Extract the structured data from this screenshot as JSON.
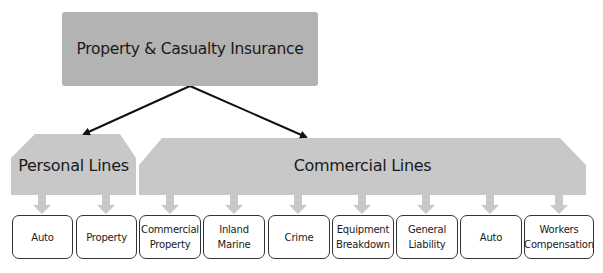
{
  "diagram": {
    "root": {
      "label": "Property & Casualty Insurance",
      "color": "#b3b3b3"
    },
    "categories": [
      {
        "label": "Personal Lines",
        "color": "#c8c8c8",
        "children": [
          {
            "label": "Auto"
          },
          {
            "label": "Property"
          }
        ]
      },
      {
        "label": "Commercial Lines",
        "color": "#c8c8c8",
        "children": [
          {
            "label": "Commercial\nProperty"
          },
          {
            "label": "Inland\nMarine"
          },
          {
            "label": "Crime"
          },
          {
            "label": "Equipment\nBreakdown"
          },
          {
            "label": "General\nLiability"
          },
          {
            "label": "Auto"
          },
          {
            "label": "Workers\nCompensation"
          }
        ]
      }
    ]
  }
}
